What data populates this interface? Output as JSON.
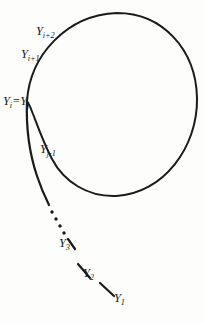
{
  "figure": {
    "kind": "rho-shaped-sequence-diagram",
    "background_color": "#fdfdfc",
    "ink_color": "#1a1a1a"
  },
  "labels": {
    "y_i_plus_2": {
      "base": "Y",
      "sub": "i+2"
    },
    "y_i_plus_1": {
      "base": "Y",
      "sub": "i+1"
    },
    "y_i": {
      "base": "Y",
      "sub": "i"
    },
    "equals": {
      "text": "="
    },
    "y_j": {
      "base": "Y",
      "sub": "j"
    },
    "y_j_minus_1": {
      "base": "Y",
      "sub": "j-1"
    },
    "y_3": {
      "base": "Y",
      "sub": "3"
    },
    "y_2": {
      "base": "Y",
      "sub": "2"
    },
    "y_1": {
      "base": "Y",
      "sub": "1"
    }
  },
  "geometry": {
    "canvas": {
      "width": 204,
      "height": 323
    },
    "cycle": {
      "shape": "circle",
      "center_x": 120,
      "center_y": 105,
      "radius": 77,
      "stroke_width": 2.0
    },
    "junction_point": {
      "x": 27,
      "y": 101
    },
    "tail": {
      "stroke_width": 2.2,
      "start_point": {
        "x": 115,
        "y": 295
      },
      "end_point": {
        "x": 27,
        "y": 101
      },
      "ellipsis_dot_count": 4
    }
  }
}
